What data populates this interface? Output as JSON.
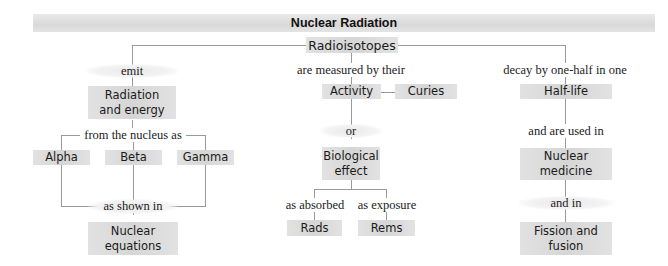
{
  "title": "Nuclear Radiation",
  "root": "Radioisotopes",
  "left_branch": {
    "link1": "emit",
    "node1": "Radiation and energy",
    "link2": "from the nucleus as",
    "types": [
      "Alpha",
      "Beta",
      "Gamma"
    ],
    "link3": "as shown in",
    "node_final": "Nuclear equations"
  },
  "middle_branch": {
    "link1": "are measured by their",
    "node1": "Activity",
    "unit": "Curies",
    "link2": "or",
    "node2": "Biological effect",
    "sub_links": [
      "as absorbed",
      "as exposure"
    ],
    "sub_nodes": [
      "Rads",
      "Rems"
    ]
  },
  "right_branch": {
    "link1": "decay by one-half in one",
    "node1": "Half-life",
    "link2": "and are used in",
    "node2": "Nuclear medicine",
    "link3": "and in",
    "node3": "Fission and fusion"
  },
  "colors": {
    "box_fill": "#d9d9d9",
    "connector": "#9a9a9a",
    "text": "#1a1a1a"
  }
}
